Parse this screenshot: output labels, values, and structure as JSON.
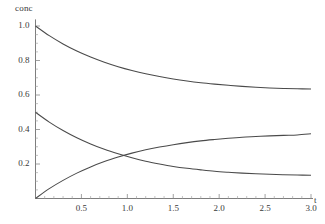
{
  "chart_data": {
    "type": "line",
    "title": "",
    "subtitle": "",
    "xlabel": "t",
    "ylabel": "conc",
    "xlim": [
      0,
      3.0
    ],
    "ylim": [
      0,
      1.05
    ],
    "grid": false,
    "legend": null,
    "xticks": [
      "0.5",
      "1.0",
      "1.5",
      "2.0",
      "2.5",
      "3.0"
    ],
    "xtick_values": [
      0.5,
      1.0,
      1.5,
      2.0,
      2.5,
      3.0
    ],
    "yticks": [
      "0.2",
      "0.4",
      "0.6",
      "0.8",
      "1.0"
    ],
    "ytick_values": [
      0.2,
      0.4,
      0.6,
      0.8,
      1.0
    ],
    "x": [
      0,
      0.15,
      0.3,
      0.45,
      0.6,
      0.75,
      0.9,
      1.05,
      1.2,
      1.35,
      1.5,
      1.65,
      1.8,
      1.95,
      2.1,
      2.25,
      2.4,
      2.55,
      2.7,
      2.85,
      3.0
    ],
    "series": [
      {
        "name": "curve-a",
        "color": "#4a4a4a",
        "values": [
          1.0,
          0.944,
          0.896,
          0.855,
          0.82,
          0.79,
          0.764,
          0.742,
          0.723,
          0.707,
          0.693,
          0.681,
          0.671,
          0.663,
          0.656,
          0.65,
          0.645,
          0.641,
          0.638,
          0.636,
          0.635
        ]
      },
      {
        "name": "curve-b",
        "color": "#4a4a4a",
        "values": [
          0.5,
          0.443,
          0.394,
          0.352,
          0.316,
          0.285,
          0.259,
          0.236,
          0.216,
          0.2,
          0.186,
          0.175,
          0.166,
          0.158,
          0.152,
          0.147,
          0.143,
          0.14,
          0.138,
          0.136,
          0.135
        ]
      },
      {
        "name": "curve-c",
        "color": "#4a4a4a",
        "values": [
          0.0,
          0.057,
          0.105,
          0.147,
          0.183,
          0.214,
          0.24,
          0.263,
          0.282,
          0.298,
          0.312,
          0.324,
          0.334,
          0.342,
          0.349,
          0.355,
          0.359,
          0.363,
          0.366,
          0.368,
          0.375
        ]
      }
    ],
    "annotations": [
      {
        "name": "crossing-point",
        "x": 0.85,
        "y": 0.22
      }
    ]
  }
}
